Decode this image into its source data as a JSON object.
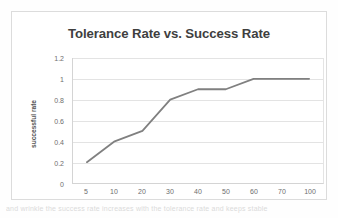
{
  "chart_data": {
    "type": "line",
    "title": "Tolerance Rate vs. Success Rate",
    "xlabel": "",
    "ylabel": "successful rate",
    "categories": [
      "5",
      "10",
      "20",
      "30",
      "40",
      "50",
      "60",
      "70",
      "100"
    ],
    "values": [
      0.2,
      0.4,
      0.5,
      0.8,
      0.9,
      0.9,
      1,
      1,
      1
    ],
    "series": [
      {
        "name": "successful rate",
        "values": [
          0.2,
          0.4,
          0.5,
          0.8,
          0.9,
          0.9,
          1,
          1,
          1
        ]
      }
    ],
    "y_ticks": [
      "0",
      "0.2",
      "0.4",
      "0.6",
      "0.8",
      "1",
      "1.2"
    ],
    "y_tick_values": [
      0,
      0.2,
      0.4,
      0.6,
      0.8,
      1,
      1.2
    ],
    "ylim": [
      0,
      1.2
    ],
    "grid": "horizontal",
    "legend": "none",
    "line_color": "#808080",
    "gridline_color": "#e3e3e3",
    "title_color": "#3f3f3f",
    "tick_label_color": "#6e6e6e"
  },
  "caption": {
    "text": "and wrinkle the success rate increases with the tolerance rate and keeps stable"
  }
}
